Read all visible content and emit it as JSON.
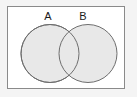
{
  "figure": {
    "type": "venn-diagram",
    "title": "",
    "background_color": "#f4f4f4",
    "universe": {
      "name": "universal-set-rectangle",
      "fill": "#ffffff",
      "stroke": "#8a8a8a",
      "stroke_width": 1,
      "x": 7,
      "y": 6,
      "width": 118,
      "height": 83
    },
    "sets": [
      {
        "label": "A",
        "name": "set-a",
        "cx": 50,
        "cy": 53.5,
        "r": 29,
        "fill": "#e8e8e8",
        "stroke": "#6e6e6e",
        "stroke_width": 1,
        "label_x": 48,
        "label_y": 20
      },
      {
        "label": "B",
        "name": "set-b",
        "cx": 88,
        "cy": 53.5,
        "r": 29,
        "fill": "#e8e8e8",
        "stroke": "#6e6e6e",
        "stroke_width": 1,
        "label_x": 83,
        "label_y": 20
      }
    ],
    "intersection": {
      "name": "intersection-region",
      "shaded": false,
      "fill": "#e8e8e8"
    }
  }
}
